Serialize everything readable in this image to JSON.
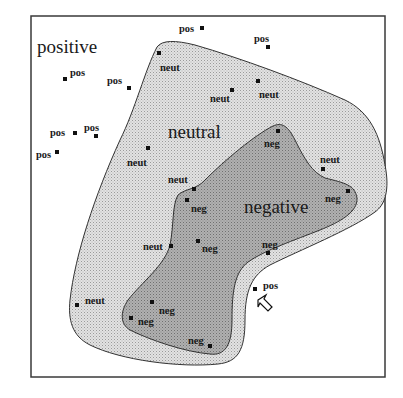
{
  "figure": {
    "region_labels": {
      "positive": "positive",
      "neutral": "neutral",
      "negative": "negative"
    },
    "colors": {
      "background": "#ffffff",
      "neutral_fill": "#d9d9d9",
      "negative_fill": "#a9a9a9",
      "outline": "#333333",
      "point": "#111111"
    },
    "points": [
      {
        "label": "pos",
        "x": 65,
        "y": 79,
        "lx": 70,
        "ly": 76
      },
      {
        "label": "pos",
        "x": 129,
        "y": 88,
        "lx": 107,
        "ly": 84
      },
      {
        "label": "pos",
        "x": 202,
        "y": 28,
        "lx": 179,
        "ly": 32
      },
      {
        "label": "pos",
        "x": 268,
        "y": 47,
        "lx": 254,
        "ly": 42
      },
      {
        "label": "pos",
        "x": 75,
        "y": 133,
        "lx": 50,
        "ly": 136
      },
      {
        "label": "pos",
        "x": 96,
        "y": 136,
        "lx": 84,
        "ly": 131
      },
      {
        "label": "pos",
        "x": 57,
        "y": 152,
        "lx": 36,
        "ly": 158
      },
      {
        "label": "pos",
        "x": 255,
        "y": 289,
        "lx": 263,
        "ly": 289
      },
      {
        "label": "neut",
        "x": 159,
        "y": 53,
        "lx": 160,
        "ly": 71
      },
      {
        "label": "neut",
        "x": 232,
        "y": 90,
        "lx": 210,
        "ly": 102
      },
      {
        "label": "neut",
        "x": 258,
        "y": 81,
        "lx": 259,
        "ly": 98
      },
      {
        "label": "neut",
        "x": 148,
        "y": 148,
        "lx": 127,
        "ly": 166
      },
      {
        "label": "neut",
        "x": 194,
        "y": 189,
        "lx": 168,
        "ly": 183
      },
      {
        "label": "neut",
        "x": 323,
        "y": 169,
        "lx": 320,
        "ly": 163
      },
      {
        "label": "neut",
        "x": 171,
        "y": 246,
        "lx": 143,
        "ly": 250
      },
      {
        "label": "neut",
        "x": 77,
        "y": 305,
        "lx": 85,
        "ly": 304
      },
      {
        "label": "neg",
        "x": 278,
        "y": 131,
        "lx": 264,
        "ly": 147
      },
      {
        "label": "neg",
        "x": 187,
        "y": 200,
        "lx": 191,
        "ly": 212
      },
      {
        "label": "neg",
        "x": 348,
        "y": 191,
        "lx": 325,
        "ly": 202
      },
      {
        "label": "neg",
        "x": 198,
        "y": 241,
        "lx": 202,
        "ly": 252
      },
      {
        "label": "neg",
        "x": 268,
        "y": 253,
        "lx": 262,
        "ly": 248
      },
      {
        "label": "neg",
        "x": 152,
        "y": 302,
        "lx": 159,
        "ly": 314
      },
      {
        "label": "neg",
        "x": 131,
        "y": 318,
        "lx": 138,
        "ly": 325
      },
      {
        "label": "neg",
        "x": 210,
        "y": 346,
        "lx": 188,
        "ly": 344
      }
    ]
  }
}
